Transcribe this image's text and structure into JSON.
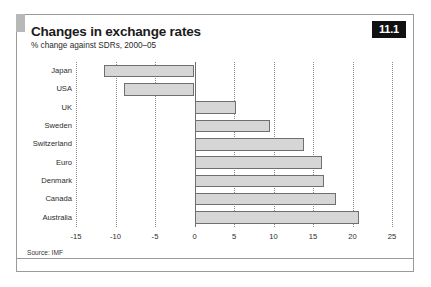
{
  "figure": {
    "number_badge": "11.1",
    "title": "Changes in exchange rates",
    "subtitle": "% change against SDRs, 2000–05",
    "source": "Source: IMF"
  },
  "chart_data": {
    "type": "bar",
    "orientation": "horizontal",
    "title": "Changes in exchange rates",
    "subtitle": "% change against SDRs, 2000–05",
    "xlabel": "",
    "ylabel": "",
    "xlim": [
      -15,
      25
    ],
    "xticks": [
      -15,
      -10,
      -5,
      0,
      5,
      10,
      15,
      20,
      25
    ],
    "xtick_labels": [
      "-15",
      "-10",
      "-5",
      "0",
      "5",
      "10",
      "15",
      "20",
      "25"
    ],
    "grid": true,
    "grid_style": "dotted-vertical",
    "legend": false,
    "bar_fill": "#d6d6d6",
    "bar_border": "#6f6f6f",
    "categories": [
      "Japan",
      "USA",
      "UK",
      "Sweden",
      "Switzerland",
      "Euro",
      "Denmark",
      "Canada",
      "Australia"
    ],
    "values": [
      -11.4,
      -8.9,
      5.2,
      9.6,
      13.9,
      16.1,
      16.4,
      17.9,
      20.8
    ],
    "source": "Source: IMF"
  }
}
